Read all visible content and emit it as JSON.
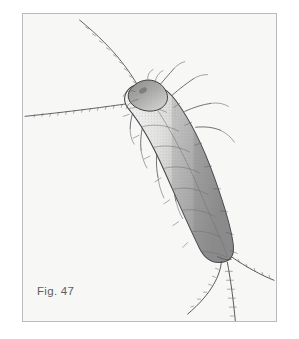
{
  "figure": {
    "caption": "Fig. 47",
    "illustration_type": "stippled line drawing",
    "frame": {
      "background_color": "#f7f7f6",
      "border_color": "#b9babb",
      "page_color": "#ffffff"
    },
    "ink_colors": {
      "outline": "#43454a",
      "shading": "#6e7074",
      "caption_text": "#5d5f61"
    }
  },
  "anatomy": {
    "head_label": "head",
    "thorax_label": "thorax",
    "abdomen_label": "abdomen",
    "antennae_count": 2,
    "cerci_count": 3,
    "legs_count": 6,
    "body_orientation": "head upper-left, tail lower-right"
  }
}
